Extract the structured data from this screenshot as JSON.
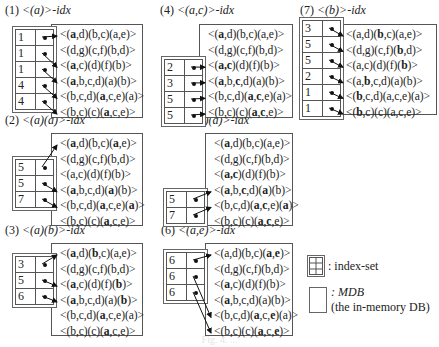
{
  "database": [
    [
      [
        "(",
        "a",
        true
      ],
      [
        ",d)(b,c)(a,e)>",
        null,
        false
      ]
    ],
    [],
    [],
    [],
    [],
    []
  ],
  "panels": [
    {
      "id": "1",
      "label": "(1) <(a)>-idx",
      "label_prefix": "(1) ",
      "label_pattern": "<(a)>",
      "label_suffix": "-idx",
      "index_rows": [
        "1",
        "1",
        "1",
        "4",
        "4"
      ],
      "sequences": [
        [
          {
            "t": "<("
          },
          {
            "t": "a",
            "b": true
          },
          {
            "t": ",d)(b,c)(a,e)>"
          }
        ],
        [
          {
            "t": "<(d,g)(c,f)(b,d)>"
          }
        ],
        [
          {
            "t": "<("
          },
          {
            "t": "a",
            "b": true
          },
          {
            "t": ",c)(d)(f)(b)>"
          }
        ],
        [
          {
            "t": "<("
          },
          {
            "t": "a",
            "b": true
          },
          {
            "t": ",b,c,d)(a)(b)>"
          }
        ],
        [
          {
            "t": "<(b,c,d)("
          },
          {
            "t": "a",
            "b": true
          },
          {
            "t": ",c,e)(a)>"
          }
        ],
        [
          {
            "t": "<(b,c)(c)("
          },
          {
            "t": "a",
            "b": true
          },
          {
            "t": ",c,e)>"
          }
        ]
      ],
      "pointers": [
        [
          0,
          0
        ],
        [
          1,
          2
        ],
        [
          2,
          3
        ],
        [
          3,
          4
        ],
        [
          4,
          5
        ]
      ]
    },
    {
      "id": "2",
      "label_prefix": "(2) ",
      "label_pattern": "<(a)(a)>",
      "label_suffix": "-idx",
      "index_rows": [
        "5",
        "5",
        "7"
      ],
      "sequences": [
        [
          {
            "t": "<("
          },
          {
            "t": "a",
            "b": true
          },
          {
            "t": ",d)(b,c)("
          },
          {
            "t": "a",
            "b": true
          },
          {
            "t": ",e)>"
          }
        ],
        [
          {
            "t": "<(d,g)(c,f)(b,d)>"
          }
        ],
        [
          {
            "t": "<(a,c)(d)(f)(b)>"
          }
        ],
        [
          {
            "t": "<("
          },
          {
            "t": "a",
            "b": true
          },
          {
            "t": ",b,c,d)("
          },
          {
            "t": "a",
            "b": true
          },
          {
            "t": ")(b)>"
          }
        ],
        [
          {
            "t": "<(b,c,d)("
          },
          {
            "t": "a",
            "b": true
          },
          {
            "t": ",c,e)("
          },
          {
            "t": "a",
            "b": true
          },
          {
            "t": ")>"
          }
        ],
        [
          {
            "t": "<(b,c)(c)("
          },
          {
            "t": "a",
            "b": true
          },
          {
            "t": ",c,e)>"
          }
        ]
      ],
      "pointers": [
        [
          0,
          0
        ],
        [
          1,
          3
        ],
        [
          2,
          4
        ]
      ]
    },
    {
      "id": "3",
      "label_prefix": "(3) ",
      "label_pattern": "<(a)(b)>",
      "label_suffix": "-idx",
      "index_rows": [
        "3",
        "5",
        "6"
      ],
      "sequences": [
        [
          {
            "t": "<("
          },
          {
            "t": "a",
            "b": true
          },
          {
            "t": ",d)("
          },
          {
            "t": "b",
            "b": true
          },
          {
            "t": ",c)(a,e)>"
          }
        ],
        [
          {
            "t": "<(d,g)(c,f)(b,d)>"
          }
        ],
        [
          {
            "t": "<("
          },
          {
            "t": "a",
            "b": true
          },
          {
            "t": ",c)(d)(f)("
          },
          {
            "t": "b",
            "b": true
          },
          {
            "t": ")>"
          }
        ],
        [
          {
            "t": "<("
          },
          {
            "t": "a",
            "b": true
          },
          {
            "t": ",b,c,d)(a)("
          },
          {
            "t": "b",
            "b": true
          },
          {
            "t": ")>"
          }
        ],
        [
          {
            "t": "<(b,c,d)("
          },
          {
            "t": "a",
            "b": true
          },
          {
            "t": ",c,e)(a)>"
          }
        ],
        [
          {
            "t": "<(b,c)(c)("
          },
          {
            "t": "a",
            "b": true
          },
          {
            "t": ",c,e)>"
          }
        ]
      ],
      "pointers": [
        [
          0,
          0
        ],
        [
          1,
          2
        ],
        [
          2,
          3
        ]
      ]
    },
    {
      "id": "4",
      "label_prefix": "(4) ",
      "label_pattern": "<(a,c)>",
      "label_suffix": "-idx",
      "index_rows": [
        "2",
        "3",
        "5",
        "5"
      ],
      "sequences": [
        [
          {
            "t": "<("
          },
          {
            "t": "a",
            "b": true
          },
          {
            "t": ",d)(b,c)(a,e)>"
          }
        ],
        [
          {
            "t": "<(d,g)(c,f)(b,d)>"
          }
        ],
        [
          {
            "t": "<("
          },
          {
            "t": "a,c",
            "b": true
          },
          {
            "t": ")(d)(f)(b)>"
          }
        ],
        [
          {
            "t": "<("
          },
          {
            "t": "a",
            "b": true
          },
          {
            "t": ",b,"
          },
          {
            "t": "c",
            "b": true
          },
          {
            "t": ",d)(a)(b)>"
          }
        ],
        [
          {
            "t": "<(b,c,d)("
          },
          {
            "t": "a",
            "b": true
          },
          {
            "t": ","
          },
          {
            "t": "c",
            "b": true
          },
          {
            "t": ",e)(a)>"
          }
        ],
        [
          {
            "t": "<(b,c)(c)("
          },
          {
            "t": "a",
            "b": true
          },
          {
            "t": ","
          },
          {
            "t": "c",
            "b": true
          },
          {
            "t": ",e)>"
          }
        ]
      ],
      "pointers": [
        [
          0,
          2
        ],
        [
          1,
          3
        ],
        [
          2,
          4
        ],
        [
          3,
          5
        ]
      ]
    },
    {
      "id": "5",
      "label_prefix": "(5) ",
      "label_pattern": "<(a,c)(a)>",
      "label_suffix": "-idx",
      "index_rows": [
        "5",
        "7"
      ],
      "sequences": [
        [
          {
            "t": "<("
          },
          {
            "t": "a",
            "b": true
          },
          {
            "t": ",d)(b,c)(a,e)>"
          }
        ],
        [
          {
            "t": "<(d,g)(c,f)(b,d)>"
          }
        ],
        [
          {
            "t": "<("
          },
          {
            "t": "a,c",
            "b": true
          },
          {
            "t": ")(d)(f)(b)>"
          }
        ],
        [
          {
            "t": "<("
          },
          {
            "t": "a",
            "b": true
          },
          {
            "t": ",b,"
          },
          {
            "t": "c",
            "b": true
          },
          {
            "t": ",d)("
          },
          {
            "t": "a",
            "b": true
          },
          {
            "t": ")(b)>"
          }
        ],
        [
          {
            "t": "<(b,c,d)("
          },
          {
            "t": "a",
            "b": true
          },
          {
            "t": ","
          },
          {
            "t": "c",
            "b": true
          },
          {
            "t": ",e)("
          },
          {
            "t": "a",
            "b": true
          },
          {
            "t": ")>"
          }
        ],
        [
          {
            "t": "<(b,c)(c)("
          },
          {
            "t": "a",
            "b": true
          },
          {
            "t": ","
          },
          {
            "t": "c",
            "b": true
          },
          {
            "t": ",e)>"
          }
        ]
      ],
      "pointers": [
        [
          0,
          3
        ],
        [
          1,
          4
        ]
      ]
    },
    {
      "id": "6",
      "label_prefix": "(6) ",
      "label_pattern": "<(a,e)>",
      "label_suffix": "-idx",
      "index_rows": [
        "6",
        "6",
        "6"
      ],
      "sequences": [
        [
          {
            "t": "<(a,d)(b,c)("
          },
          {
            "t": "a",
            "b": true
          },
          {
            "t": ","
          },
          {
            "t": "e",
            "b": true
          },
          {
            "t": ")>"
          }
        ],
        [
          {
            "t": "<(d,g)(c,f)(b,d)>"
          }
        ],
        [
          {
            "t": "<("
          },
          {
            "t": "a",
            "b": true
          },
          {
            "t": ",c)(d)(f)(b)>"
          }
        ],
        [
          {
            "t": "<("
          },
          {
            "t": "a",
            "b": true
          },
          {
            "t": ",b,c,d)(a)(b)>"
          }
        ],
        [
          {
            "t": "<(b,c,d)("
          },
          {
            "t": "a",
            "b": true
          },
          {
            "t": ",c,"
          },
          {
            "t": "e",
            "b": true
          },
          {
            "t": ")(a)>"
          }
        ],
        [
          {
            "t": "<(b,c)(c)("
          },
          {
            "t": "a",
            "b": true
          },
          {
            "t": ",c,"
          },
          {
            "t": "e",
            "b": true
          },
          {
            "t": ")>"
          }
        ]
      ],
      "pointers": [
        [
          0,
          0
        ],
        [
          1,
          4
        ],
        [
          2,
          5
        ]
      ]
    },
    {
      "id": "7",
      "label_prefix": "(7) ",
      "label_pattern": "<(b)>",
      "label_suffix": "-idx",
      "index_rows": [
        "3",
        "5",
        "5",
        "2",
        "1",
        "1"
      ],
      "sequences": [
        [
          {
            "t": "<(a,d)("
          },
          {
            "t": "b",
            "b": true
          },
          {
            "t": ",c)(a,e)>"
          }
        ],
        [
          {
            "t": "<(d,g)(c,f)("
          },
          {
            "t": "b",
            "b": true
          },
          {
            "t": ",d)>"
          }
        ],
        [
          {
            "t": "<(a,c)(d)(f)("
          },
          {
            "t": "b",
            "b": true
          },
          {
            "t": ")>"
          }
        ],
        [
          {
            "t": "<(a,"
          },
          {
            "t": "b",
            "b": true
          },
          {
            "t": ",c,d)(a)(b)>"
          }
        ],
        [
          {
            "t": "<("
          },
          {
            "t": "b",
            "b": true
          },
          {
            "t": ",c,d)(a,c,e)(a)>"
          }
        ],
        [
          {
            "t": "<("
          },
          {
            "t": "b",
            "b": true
          },
          {
            "t": ",c)(c)(a,c,e)>"
          }
        ]
      ],
      "pointers": [
        [
          0,
          0
        ],
        [
          1,
          1
        ],
        [
          2,
          2
        ],
        [
          3,
          3
        ],
        [
          4,
          4
        ],
        [
          5,
          5
        ]
      ]
    }
  ],
  "legend": {
    "index_set_label": ": index-set",
    "mdb_label": ": MDB",
    "mdb_sublabel": "(the in-memory DB)"
  },
  "caption": "Fig. 4. ..."
}
